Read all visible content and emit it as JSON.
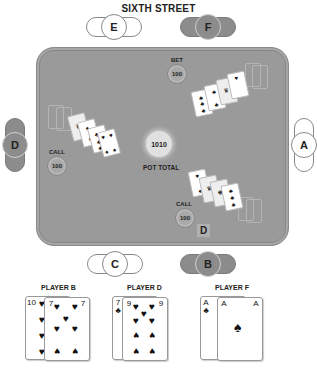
{
  "title": "SIXTH STREET",
  "seats": {
    "A": {
      "label": "A",
      "style": "light"
    },
    "B": {
      "label": "B",
      "style": "dark"
    },
    "C": {
      "label": "C",
      "style": "light"
    },
    "D": {
      "label": "D",
      "style": "dark"
    },
    "E": {
      "label": "E",
      "style": "light"
    },
    "F": {
      "label": "F",
      "style": "dark"
    }
  },
  "table": {
    "bet": {
      "label": "BET",
      "amount": "100"
    },
    "call_left": {
      "label": "CALL",
      "amount": "100"
    },
    "call_bottom": {
      "label": "CALL",
      "amount": "100"
    },
    "pot": {
      "amount": "1010",
      "label": "POT TOTAL"
    },
    "dealer_button": "D"
  },
  "hands": [
    {
      "player": "PLAYER B",
      "cards": [
        {
          "rank": "10",
          "suit": "♥"
        },
        {
          "rank": "7",
          "suit": "♥"
        }
      ]
    },
    {
      "player": "PLAYER D",
      "cards": [
        {
          "rank": "7",
          "suit": "♣"
        },
        {
          "rank": "9",
          "suit": "♥"
        }
      ]
    },
    {
      "player": "PLAYER F",
      "cards": [
        {
          "rank": "A",
          "suit": "♣"
        },
        {
          "rank": "A",
          "suit": "♠"
        }
      ]
    }
  ],
  "colors": {
    "felt": "#9a9a9a",
    "dark_seat": "#8c8c8c",
    "light_seat": "#ffffff"
  }
}
